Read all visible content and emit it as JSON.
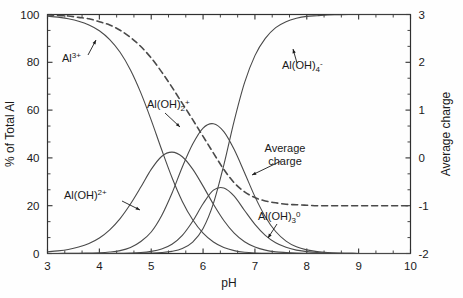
{
  "figure": {
    "name": "aluminium-speciation-diagram",
    "background": "#fefefe",
    "curve_color": "#4a4a4a",
    "axis_color": "#303030",
    "text_color": "#1a1a1a"
  },
  "axes": {
    "x": {
      "label": "pH",
      "min": 3,
      "max": 10,
      "ticks": [
        3,
        4,
        5,
        6,
        7,
        8,
        9,
        10
      ],
      "tick_labels": [
        "3",
        "4",
        "5",
        "6",
        "7",
        "8",
        "9",
        "10"
      ],
      "minor_per_major": 2
    },
    "y_left": {
      "label": "% of Total Al",
      "min": 0,
      "max": 100,
      "ticks": [
        0,
        20,
        40,
        60,
        80,
        100
      ],
      "tick_labels": [
        "0",
        "20",
        "40",
        "60",
        "80",
        "100"
      ],
      "minor_per_major": 2
    },
    "y_right": {
      "label": "Average charge",
      "min": -2,
      "max": 3,
      "ticks": [
        -2,
        -1,
        0,
        1,
        2,
        3
      ],
      "tick_labels": [
        "-2",
        "-1",
        "0",
        "1",
        "2",
        "3"
      ],
      "minor_per_major": 2
    }
  },
  "annotations": [
    {
      "id": "al3",
      "text": "Al",
      "sup": "3+",
      "sub": "",
      "x": 62,
      "y": 62,
      "arrow": [
        [
          88,
          55
        ],
        [
          96,
          40
        ]
      ]
    },
    {
      "id": "aloh2",
      "text": "Al(OH)",
      "sup": "2+",
      "sub": "",
      "x": 64,
      "y": 199,
      "arrow": [
        [
          122,
          201
        ],
        [
          140,
          210
        ]
      ]
    },
    {
      "id": "aloh2p",
      "text": "Al(OH)",
      "sup": "+",
      "sub": "2",
      "x": 147,
      "y": 108,
      "arrow": [
        [
          165,
          113
        ],
        [
          180,
          127
        ]
      ]
    },
    {
      "id": "aloh3",
      "text": "Al(OH)",
      "sup": "0",
      "sub": "3",
      "x": 258,
      "y": 220,
      "arrow": [
        [
          277,
          224
        ],
        [
          268,
          238
        ]
      ]
    },
    {
      "id": "aloh4",
      "text": "Al(OH)",
      "sup": "-",
      "sub": "4",
      "x": 282,
      "y": 69,
      "arrow": [
        [
          297,
          63
        ],
        [
          293,
          49
        ]
      ]
    },
    {
      "id": "avgcharge",
      "text": "Average charge",
      "sup": "",
      "sub": "",
      "x": 285,
      "y": 152,
      "arrow": [
        [
          281,
          161
        ],
        [
          252,
          175
        ]
      ]
    }
  ],
  "chart_data": {
    "type": "line",
    "title": "",
    "xlabel": "pH",
    "ylabel": "% of Total Al",
    "ylabel_right": "Average charge",
    "xlim": [
      3,
      10
    ],
    "ylim": [
      0,
      100
    ],
    "ylim_right": [
      -2,
      3
    ],
    "grid": false,
    "legend": "none (inline labels with leader arrows)",
    "x": [
      3.0,
      3.2,
      3.4,
      3.6,
      3.8,
      4.0,
      4.2,
      4.4,
      4.6,
      4.8,
      5.0,
      5.2,
      5.4,
      5.6,
      5.8,
      6.0,
      6.2,
      6.4,
      6.6,
      6.8,
      7.0,
      7.2,
      7.4,
      7.6,
      7.8,
      8.0,
      8.2,
      8.4,
      8.6,
      8.8,
      9.0,
      9.2,
      9.4,
      9.6,
      9.8,
      10.0
    ],
    "series": [
      {
        "name": "Al3+",
        "label": "Al",
        "superscript": "3+",
        "style": "solid",
        "axis": "left",
        "values": [
          99.3,
          98.9,
          98.2,
          97.2,
          95.6,
          93.2,
          89.5,
          84.2,
          76.8,
          67.2,
          55.8,
          43.5,
          31.8,
          21.8,
          14.1,
          8.5,
          4.8,
          2.5,
          1.2,
          0.5,
          0.2,
          0.1,
          0.0,
          0.0,
          0.0,
          0.0,
          0.0,
          0.0,
          0.0,
          0.0,
          0.0,
          0.0,
          0.0,
          0.0,
          0.0,
          0.0
        ]
      },
      {
        "name": "Al(OH)2+",
        "label": "Al(OH)",
        "superscript": "2+",
        "style": "solid",
        "axis": "left",
        "values": [
          0.7,
          1.1,
          1.7,
          2.7,
          4.2,
          6.5,
          9.9,
          14.6,
          20.7,
          27.8,
          35.2,
          40.6,
          42.4,
          40.5,
          35.3,
          28.2,
          20.6,
          13.8,
          8.5,
          4.9,
          2.7,
          1.4,
          0.7,
          0.4,
          0.2,
          0.1,
          0.0,
          0.0,
          0.0,
          0.0,
          0.0,
          0.0,
          0.0,
          0.0,
          0.0,
          0.0
        ]
      },
      {
        "name": "Al(OH)2+ (dihydroxy)",
        "label": "Al(OH)",
        "subscript": "2",
        "superscript": "+",
        "style": "solid",
        "axis": "left",
        "values": [
          0.0,
          0.0,
          0.1,
          0.1,
          0.2,
          0.3,
          0.6,
          1.2,
          2.5,
          5.0,
          9.0,
          15.8,
          25.2,
          36.2,
          45.8,
          52.5,
          54.3,
          51.0,
          43.5,
          33.8,
          23.8,
          15.4,
          9.2,
          5.2,
          2.8,
          1.5,
          0.8,
          0.4,
          0.2,
          0.1,
          0.0,
          0.0,
          0.0,
          0.0,
          0.0,
          0.0
        ]
      },
      {
        "name": "Al(OH)3 0",
        "label": "Al(OH)",
        "subscript": "3",
        "superscript": "0",
        "style": "solid",
        "axis": "left",
        "values": [
          0.0,
          0.0,
          0.0,
          0.0,
          0.0,
          0.0,
          0.0,
          0.1,
          0.2,
          0.4,
          0.9,
          1.9,
          3.9,
          7.6,
          13.5,
          20.8,
          26.5,
          27.4,
          24.0,
          18.0,
          12.2,
          7.6,
          4.5,
          2.6,
          1.4,
          0.8,
          0.4,
          0.2,
          0.1,
          0.1,
          0.0,
          0.0,
          0.0,
          0.0,
          0.0,
          0.0
        ]
      },
      {
        "name": "Al(OH)4-",
        "label": "Al(OH)",
        "subscript": "4",
        "superscript": "-",
        "style": "solid",
        "axis": "left",
        "values": [
          0.0,
          0.0,
          0.0,
          0.0,
          0.0,
          0.0,
          0.0,
          0.0,
          0.0,
          0.1,
          0.2,
          0.4,
          0.9,
          2.1,
          4.8,
          10.5,
          21.0,
          37.0,
          55.5,
          71.5,
          82.8,
          90.0,
          94.5,
          97.0,
          98.4,
          99.2,
          99.5,
          99.8,
          99.9,
          100.0,
          100.0,
          100.0,
          100.0,
          100.0,
          100.0,
          100.0
        ]
      },
      {
        "name": "Average charge",
        "label": "Average charge",
        "style": "dashed",
        "axis": "right",
        "values": [
          2.99,
          2.98,
          2.97,
          2.94,
          2.91,
          2.85,
          2.78,
          2.67,
          2.52,
          2.33,
          2.09,
          1.8,
          1.48,
          1.14,
          0.8,
          0.45,
          0.1,
          -0.24,
          -0.52,
          -0.71,
          -0.83,
          -0.9,
          -0.94,
          -0.97,
          -0.98,
          -0.99,
          -1.0,
          -1.0,
          -1.0,
          -1.0,
          -1.0,
          -1.0,
          -1.0,
          -1.0,
          -1.0,
          -1.0
        ]
      }
    ]
  }
}
